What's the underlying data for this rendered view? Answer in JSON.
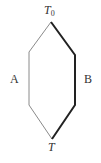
{
  "diagram": {
    "labels": {
      "top": "T",
      "top_subscript": "0",
      "bottom": "T",
      "left_path": "A",
      "right_path": "B"
    },
    "colors": {
      "path_a": "#8a8a8a",
      "path_b": "#222222",
      "text": "#333333"
    },
    "vertices": {
      "top": [
        51,
        22
      ],
      "upper_left": [
        29,
        52
      ],
      "lower_left": [
        29,
        105
      ],
      "bottom": [
        52,
        139
      ],
      "upper_right": [
        75,
        55
      ],
      "lower_right": [
        75,
        105
      ]
    }
  }
}
